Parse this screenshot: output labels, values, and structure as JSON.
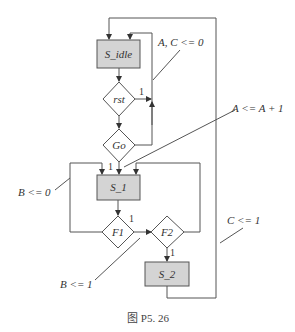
{
  "diagram": {
    "type": "ASMD chart",
    "states": [
      {
        "id": "S_idle",
        "label": "S_idle"
      },
      {
        "id": "S_1",
        "label": "S_1"
      },
      {
        "id": "S_2",
        "label": "S_2"
      }
    ],
    "decisions": [
      {
        "id": "rst",
        "label": "rst",
        "true_label": "1"
      },
      {
        "id": "Go",
        "label": "Go",
        "true_label": "1"
      },
      {
        "id": "F1",
        "label": "F1",
        "true_label": "1"
      },
      {
        "id": "F2",
        "label": "F2",
        "true_label": "1"
      }
    ],
    "annotations": {
      "a_c_reset": "A, C <= 0",
      "a_increment": "A <= A + 1",
      "b_reset": "B <= 0",
      "b_set": "B <= 1",
      "c_set": "C <= 1"
    },
    "caption": "图 P5. 26"
  }
}
